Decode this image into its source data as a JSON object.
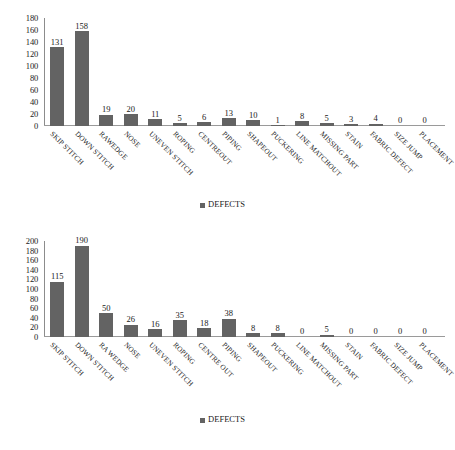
{
  "chart_data": [
    {
      "type": "bar",
      "id": "top",
      "title": "",
      "xlabel": "",
      "ylabel": "",
      "ylim": [
        0,
        180
      ],
      "yticks": [
        0,
        20,
        40,
        60,
        80,
        100,
        120,
        140,
        160,
        180
      ],
      "grid": false,
      "legend_position": "bottom-center",
      "legend": [
        "DEFECTS"
      ],
      "series_name": "DEFECTS",
      "bar_color": "#636363",
      "categories": [
        "SKIP STITCH",
        "DOWN STITCH",
        "RAWEDGE",
        "NOSE",
        "UNEVEN STITCH",
        "ROPING",
        "CENTREOUT",
        "PIPING",
        "SHAPEOUT",
        "PUCKERING",
        "LINE MATCHOUT",
        "MISSING PART",
        "STAIN",
        "FABRIC DEFECT",
        "SIZE JUMP",
        "PLACEMENT"
      ],
      "values": [
        131,
        158,
        19,
        20,
        11,
        5,
        6,
        13,
        10,
        1,
        8,
        5,
        3,
        4,
        0,
        0
      ]
    },
    {
      "type": "bar",
      "id": "bottom",
      "title": "",
      "xlabel": "",
      "ylabel": "",
      "ylim": [
        0,
        200
      ],
      "yticks": [
        0,
        20,
        40,
        60,
        80,
        100,
        120,
        140,
        160,
        180,
        200
      ],
      "grid": false,
      "legend_position": "bottom-center",
      "legend": [
        "DEFECTS"
      ],
      "series_name": "DEFECTS",
      "bar_color": "#636363",
      "categories": [
        "SKIP STITCH",
        "DOWN STITCH",
        "RA WEDGE",
        "NOSE",
        "UNEVEN STITCH",
        "ROPING",
        "CENTRE OUT",
        "PIPING",
        "SHAPEOUT",
        "PUCKERING",
        "LINE MATCHOUT",
        "MISSING PART",
        "STAIN",
        "FABRIC DEFECT",
        "SIZE JUMP",
        "PLACEMENT"
      ],
      "values": [
        115,
        190,
        50,
        26,
        16,
        35,
        18,
        38,
        8,
        8,
        0,
        5,
        0,
        0,
        0,
        0
      ]
    }
  ],
  "caption": {
    "text": ""
  }
}
